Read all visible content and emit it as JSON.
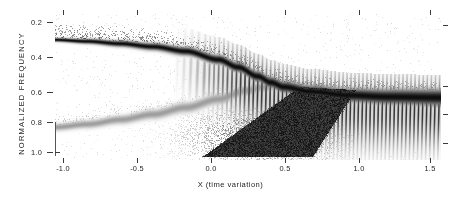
{
  "figure": {
    "type": "spectrogram",
    "background": "#ffffff",
    "ink": "#1a1a1a"
  },
  "axes": {
    "ylabel": "NORMALIZED  FREQUENCY",
    "xlabel": "X (time variation)",
    "y_ticks": [
      "0.2",
      "0.4",
      "0.6",
      "0.8",
      "1.0"
    ],
    "x_ticks": [
      "-1.0",
      "-0.5",
      "0.0",
      "0.5",
      "1.0",
      "1.5"
    ]
  },
  "chart_data": {
    "type": "heatmap",
    "title": "",
    "subtitle": "",
    "xlabel": "X (time variation)",
    "ylabel": "NORMALIZED  FREQUENCY",
    "xlim": [
      -1.25,
      1.7
    ],
    "ylim": [
      1.08,
      0.12
    ],
    "y_inverted": true,
    "xtick_values": [
      -1.0,
      -0.5,
      0.0,
      0.5,
      1.0,
      1.5
    ],
    "xtick_labels": [
      "-1.0",
      "-0.5",
      "0.0",
      "0.5",
      "1.0",
      "1.5"
    ],
    "ytick_values": [
      0.2,
      0.4,
      0.6,
      0.8,
      1.0
    ],
    "ytick_labels": [
      "0.2",
      "0.4",
      "0.6",
      "0.8",
      "1.0"
    ],
    "grid": false,
    "legend": null,
    "colormap": "grayscale",
    "colormap_low": "#ffffff",
    "colormap_high": "#000000",
    "series": [
      {
        "name": "upper-chirp-ridge",
        "kind": "ridge",
        "comment": "Dark band entering near f=0.29 at x=-1.25, bending downward in frequency toward f~1.0 near x=0.4, then spreading into a fringed fan to the right.",
        "x": [
          -1.25,
          -1.0,
          -0.75,
          -0.5,
          -0.25,
          0.0,
          0.15,
          0.3,
          0.4,
          0.5,
          0.7,
          1.0,
          1.3,
          1.7
        ],
        "y": [
          0.29,
          0.3,
          0.315,
          0.335,
          0.365,
          0.42,
          0.47,
          0.53,
          0.57,
          0.6,
          0.63,
          0.655,
          0.665,
          0.67
        ]
      },
      {
        "name": "lower-chirp-ridge",
        "kind": "ridge",
        "comment": "Faint band rising from f~0.86 at the left edge to meet the crossing region near x=0.3.",
        "x": [
          -1.25,
          -1.0,
          -0.75,
          -0.5,
          -0.25,
          0.0,
          0.2,
          0.35
        ],
        "y": [
          0.865,
          0.845,
          0.815,
          0.78,
          0.735,
          0.68,
          0.625,
          0.6
        ]
      },
      {
        "name": "cross-term-fringes",
        "kind": "interference",
        "comment": "Dense vertical striped fringes filling the fan between the two ridges, strongest for x > -0.1.",
        "x_start": -0.35,
        "x_end": 1.7,
        "fringe_count": 78
      },
      {
        "name": "dark-wedge",
        "kind": "blob",
        "comment": "Solid dark triangular wedge in the lower half, apex near (0.05, 1.06), widening upward-right to about (0.95, 0.66).",
        "vertices": [
          [
            -0.12,
            1.06
          ],
          [
            0.62,
            0.6
          ],
          [
            1.05,
            0.62
          ],
          [
            0.72,
            1.06
          ]
        ]
      }
    ]
  }
}
